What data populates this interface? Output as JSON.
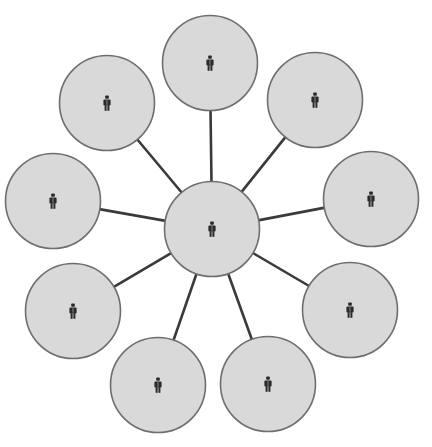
{
  "diagram": {
    "type": "hub-and-spoke network",
    "width": 432,
    "height": 447,
    "colors": {
      "background": "#ffffff",
      "node_fill": "#d9d9d9",
      "node_stroke": "#6e6e6e",
      "spoke": "#3a3a3a",
      "icon": "#2a2a2a"
    },
    "node_radius": 47.5,
    "hub": {
      "id": "hub",
      "icon": "person-icon",
      "cx": 212,
      "cy": 229
    },
    "spokes": [
      {
        "id": "node-top",
        "icon": "person-icon",
        "cx": 210,
        "cy": 63
      },
      {
        "id": "node-top-right",
        "icon": "person-icon",
        "cx": 315,
        "cy": 100
      },
      {
        "id": "node-right",
        "icon": "person-icon",
        "cx": 371,
        "cy": 199
      },
      {
        "id": "node-bottom-right",
        "icon": "person-icon",
        "cx": 350,
        "cy": 310
      },
      {
        "id": "node-bottom-center-right",
        "icon": "person-icon",
        "cx": 268,
        "cy": 384
      },
      {
        "id": "node-bottom-center-left",
        "icon": "person-icon",
        "cx": 158,
        "cy": 385
      },
      {
        "id": "node-bottom-left",
        "icon": "person-icon",
        "cx": 73,
        "cy": 311
      },
      {
        "id": "node-left",
        "icon": "person-icon",
        "cx": 53,
        "cy": 201
      },
      {
        "id": "node-top-left",
        "icon": "person-icon",
        "cx": 107,
        "cy": 103
      }
    ]
  }
}
